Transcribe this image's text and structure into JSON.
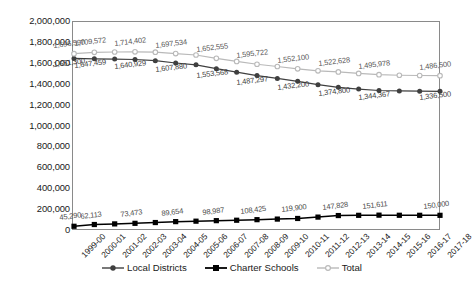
{
  "chart_data": {
    "type": "line",
    "title": "",
    "xlabel": "",
    "ylabel": "",
    "ylim": [
      0,
      2000000
    ],
    "ytick_step": 200000,
    "grid": false,
    "legend_position": "bottom",
    "categories": [
      "1999-00",
      "2000-01",
      "2001-02",
      "2002-03",
      "2003-04",
      "2004-05",
      "2005-06",
      "2006-07",
      "2007-08",
      "2008-09",
      "2009-10",
      "2010-11",
      "2011-12",
      "2012-13",
      "2013-14",
      "2014-15",
      "2015-16",
      "2016-17",
      "2017-18"
    ],
    "ytick_labels": [
      "2,000,000",
      "1,800,000",
      "1,600,000",
      "1,400,000",
      "1,200,000",
      "1,000,000",
      "800,000",
      "600,000",
      "400,000",
      "200,000",
      "0"
    ],
    "series": [
      {
        "name": "Local Districts",
        "marker": "circle",
        "color": "#3f3f3f",
        "values": [
          1651300,
          1647459,
          1645000,
          1640929,
          1630000,
          1607880,
          1590000,
          1553568,
          1520000,
          1487297,
          1460000,
          1432200,
          1400000,
          1374800,
          1358000,
          1344367,
          1340000,
          1338000,
          1336500
        ],
        "labels": [
          {
            "index": 0,
            "text": "1,651,300"
          },
          {
            "index": 1,
            "text": "1,647,459"
          },
          {
            "index": 3,
            "text": "1,640,929"
          },
          {
            "index": 5,
            "text": "1,607,880"
          },
          {
            "index": 7,
            "text": "1,553,568"
          },
          {
            "index": 9,
            "text": "1,487,297"
          },
          {
            "index": 11,
            "text": "1,432,200"
          },
          {
            "index": 13,
            "text": "1,374,800"
          },
          {
            "index": 15,
            "text": "1,344,367"
          },
          {
            "index": 18,
            "text": "1,336,500"
          }
        ]
      },
      {
        "name": "Charter Schools",
        "marker": "square",
        "color": "#000000",
        "values": [
          45290,
          62113,
          68000,
          73473,
          81000,
          89654,
          94000,
          98987,
          103000,
          108425,
          114000,
          119900,
          133000,
          147828,
          150000,
          151611,
          150500,
          150200,
          150000
        ],
        "labels": [
          {
            "index": 0,
            "text": "45,290"
          },
          {
            "index": 1,
            "text": "62,113"
          },
          {
            "index": 3,
            "text": "73,473"
          },
          {
            "index": 5,
            "text": "89,654"
          },
          {
            "index": 7,
            "text": "98,987"
          },
          {
            "index": 9,
            "text": "108,425"
          },
          {
            "index": 11,
            "text": "119,900"
          },
          {
            "index": 13,
            "text": "147,828"
          },
          {
            "index": 15,
            "text": "151,611"
          },
          {
            "index": 18,
            "text": "150,000"
          }
        ]
      },
      {
        "name": "Total",
        "marker": "circle-open",
        "color": "#b9b9b9",
        "values": [
          1696590,
          1709572,
          1713000,
          1714402,
          1711000,
          1697534,
          1684000,
          1652555,
          1623000,
          1595722,
          1574000,
          1552100,
          1533000,
          1522628,
          1508000,
          1495978,
          1490500,
          1488200,
          1486500
        ],
        "labels": [
          {
            "index": 0,
            "text": "1,696,590"
          },
          {
            "index": 1,
            "text": "1,709,572"
          },
          {
            "index": 3,
            "text": "1,714,402"
          },
          {
            "index": 5,
            "text": "1,697,534"
          },
          {
            "index": 7,
            "text": "1,652,555"
          },
          {
            "index": 9,
            "text": "1,595,722"
          },
          {
            "index": 11,
            "text": "1,552,100"
          },
          {
            "index": 13,
            "text": "1,522,628"
          },
          {
            "index": 15,
            "text": "1,495,978"
          },
          {
            "index": 18,
            "text": "1,486,500"
          }
        ]
      }
    ]
  },
  "legend": {
    "items": [
      {
        "label": "Local Districts",
        "marker": "circle",
        "color": "#3f3f3f"
      },
      {
        "label": "Charter Schools",
        "marker": "square",
        "color": "#000000"
      },
      {
        "label": "Total",
        "marker": "circle-open",
        "color": "#b9b9b9"
      }
    ]
  }
}
